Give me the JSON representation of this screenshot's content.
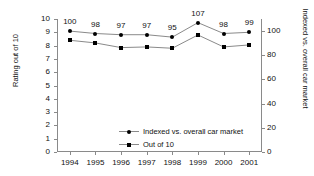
{
  "chart_data": {
    "type": "line",
    "title": "",
    "xlabel": "",
    "ylabel": "Rating out of 10",
    "y2label": "Indexed vs. overall car market",
    "categories": [
      "1994",
      "1995",
      "1996",
      "1997",
      "1998",
      "1999",
      "2000",
      "2001"
    ],
    "ylim": [
      0,
      10
    ],
    "yticks": [
      0,
      1,
      2,
      3,
      4,
      5,
      6,
      7,
      8,
      9,
      10
    ],
    "y2lim": [
      0,
      110
    ],
    "y2ticks": [
      0,
      20,
      40,
      60,
      80,
      100
    ],
    "grid": false,
    "legend_position": "inside-lower-left",
    "series": [
      {
        "name": "Indexed vs. overall car market",
        "axis": "right",
        "marker": "circle",
        "values": [
          100,
          98,
          97,
          97,
          95,
          107,
          98,
          99
        ],
        "data_labels": [
          "100",
          "98",
          "97",
          "97",
          "95",
          "107",
          "98",
          "99"
        ]
      },
      {
        "name": "Out of 10",
        "axis": "left",
        "marker": "square",
        "values": [
          8.4,
          8.2,
          7.85,
          7.9,
          7.8,
          8.8,
          7.9,
          8.05
        ],
        "data_labels": []
      }
    ],
    "colors": {
      "line": "#8a8a8a",
      "marker": "#000000",
      "axis": "#8a8a8a",
      "text": "#111111",
      "background": "#ffffff"
    }
  },
  "legend": {
    "items": [
      {
        "label": "Indexed vs. overall car market",
        "marker": "circle"
      },
      {
        "label": "Out of 10",
        "marker": "square"
      }
    ]
  }
}
